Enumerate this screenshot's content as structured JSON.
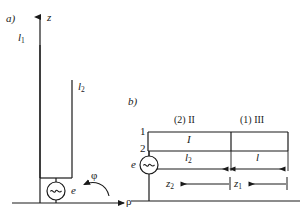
{
  "figure": {
    "type": "schematic-diagram",
    "stroke_color": "#1a1a1a",
    "background_color": "#ffffff",
    "panels": [
      {
        "tag": "a)",
        "name": "antenna-geometry",
        "axes": {
          "vertical": "z",
          "horizontal": "ρ",
          "angular": "φ"
        },
        "labels": [
          "l",
          "1",
          "l",
          "2",
          "e"
        ]
      },
      {
        "tag": "b)",
        "name": "transmission-line-model",
        "regions": [
          "(2) II",
          "(1) III"
        ],
        "terminals": [
          "1",
          "2"
        ],
        "labels": [
          "I",
          "l",
          "2",
          "l",
          "z",
          "2",
          "z",
          "1",
          "e"
        ]
      }
    ]
  },
  "panel_a": {
    "tag": "a)",
    "axis_z": "z",
    "axis_rho": "ρ",
    "angle_phi": "φ",
    "length_l1_base": "l",
    "length_l1_sub": "1",
    "length_l2_base": "l",
    "length_l2_sub": "2",
    "source_label": "e",
    "source_symbol": "∼"
  },
  "panel_b": {
    "tag": "b)",
    "region_left": "(2) II",
    "region_right": "(1) III",
    "terminal_top": "1",
    "terminal_bottom": "2",
    "current_label": "I",
    "dim_l2_base": "l",
    "dim_l2_sub": "2",
    "dim_l": "l",
    "coord_z2_base": "z",
    "coord_z2_sub": "2",
    "coord_z1_base": "z",
    "coord_z1_sub": "1",
    "source_label": "e",
    "source_symbol": "∼"
  }
}
